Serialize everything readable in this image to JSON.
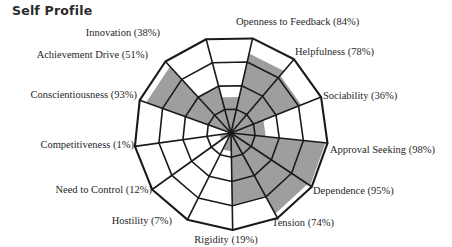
{
  "page": {
    "title": "Self Profile"
  },
  "colors": {
    "fill": "#9e9e9e",
    "stroke": "#1a1a1a",
    "background": "#ffffff",
    "grid": "#1a1a1a",
    "text": "#1f1f1f",
    "title_text": "#2b2b2b"
  },
  "chart_data": {
    "type": "pie",
    "title": "Self Profile",
    "subtitle": "",
    "xlabel": "",
    "ylabel": "",
    "units": "%",
    "rings": 4,
    "ring_values": [
      25,
      50,
      75,
      100
    ],
    "grid": true,
    "legend": "none",
    "ylim": [
      0,
      100
    ],
    "start_angle_deg": -77.15,
    "direction": "clockwise",
    "categories": [
      "Openness to Feedback",
      "Helpfulness",
      "Sociability",
      "Approval Seeking",
      "Dependence",
      "Tension",
      "Rigidity",
      "Hostility",
      "Need to Control",
      "Competitiveness",
      "Conscientiousness",
      "Achievement Drive",
      "Innovation"
    ],
    "values": [
      84,
      78,
      36,
      98,
      95,
      74,
      19,
      7,
      12,
      1,
      93,
      51,
      38
    ],
    "points": [
      {
        "label": "Openness to Feedback",
        "value": 84,
        "text": "Openness to Feedback (84%)"
      },
      {
        "label": "Helpfulness",
        "value": 78,
        "text": "Helpfulness (78%)"
      },
      {
        "label": "Sociability",
        "value": 36,
        "text": "Sociability (36%)"
      },
      {
        "label": "Approval Seeking",
        "value": 98,
        "text": "Approval Seeking (98%)"
      },
      {
        "label": "Dependence",
        "value": 95,
        "text": "Dependence (95%)"
      },
      {
        "label": "Tension",
        "value": 74,
        "text": "Tension (74%)"
      },
      {
        "label": "Rigidity",
        "value": 19,
        "text": "Rigidity (19%)"
      },
      {
        "label": "Hostility",
        "value": 7,
        "text": "Hostility (7%)"
      },
      {
        "label": "Need to Control",
        "value": 12,
        "text": "Need to Control (12%)"
      },
      {
        "label": "Competitiveness",
        "value": 1,
        "text": "Competitiveness (1%)"
      },
      {
        "label": "Conscientiousness",
        "value": 93,
        "text": "Conscientiousness (93%)"
      },
      {
        "label": "Achievement Drive",
        "value": 51,
        "text": "Achievement Drive (51%)"
      },
      {
        "label": "Innovation",
        "value": 38,
        "text": "Innovation (38%)"
      }
    ]
  },
  "labels": [
    {
      "text": "Innovation (38%)",
      "x": 160,
      "y": 33,
      "align": "lbl-l"
    },
    {
      "text": "Openness to Feedback (84%)",
      "x": 236,
      "y": 22,
      "align": "lbl-r"
    },
    {
      "text": "Achievement Drive (51%)",
      "x": 148,
      "y": 55,
      "align": "lbl-l"
    },
    {
      "text": "Helpfulness (78%)",
      "x": 295,
      "y": 52,
      "align": "lbl-r"
    },
    {
      "text": "Conscientiousness (93%)",
      "x": 137,
      "y": 95,
      "align": "lbl-l"
    },
    {
      "text": "Sociability (36%)",
      "x": 323,
      "y": 96,
      "align": "lbl-r"
    },
    {
      "text": "Competitiveness (1%)",
      "x": 134,
      "y": 145,
      "align": "lbl-l"
    },
    {
      "text": "Approval Seeking (98%)",
      "x": 330,
      "y": 150,
      "align": "lbl-r"
    },
    {
      "text": "Need to Control (12%)",
      "x": 152,
      "y": 190,
      "align": "lbl-l"
    },
    {
      "text": "Dependence (95%)",
      "x": 313,
      "y": 191,
      "align": "lbl-r"
    },
    {
      "text": "Hostility (7%)",
      "x": 172,
      "y": 221,
      "align": "lbl-l"
    },
    {
      "text": "Tension (74%)",
      "x": 272,
      "y": 223,
      "align": "lbl-r"
    },
    {
      "text": "Rigidity (19%)",
      "x": 226,
      "y": 240,
      "align": "lbl-c"
    }
  ],
  "geometry": {
    "cx": 231,
    "cy": 133,
    "outer_radius": 97
  }
}
